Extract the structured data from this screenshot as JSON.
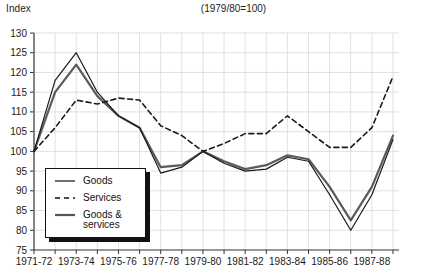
{
  "axis": {
    "y_title": "Index",
    "y_ticks": [
      130,
      125,
      120,
      115,
      110,
      105,
      100,
      95,
      90,
      85,
      80,
      75
    ],
    "x_ticks_visible": [
      "1971-72",
      "1973-74",
      "1975-76",
      "1977-78",
      "1979-80",
      "1981-82",
      "1983-84",
      "1985-86",
      "1987-88"
    ]
  },
  "legend": {
    "items": [
      {
        "label": "Goods",
        "icon": "solid-thin-line-swatch"
      },
      {
        "label": "Services",
        "icon": "dashed-line-swatch"
      },
      {
        "label": "Goods &\nservices",
        "icon": "solid-thick-line-swatch"
      }
    ]
  },
  "colors": {
    "goods": "#1a1a1a",
    "services": "#1a1a1a",
    "goods_and_services": "#5a5a5a",
    "grid": "#d8d8d8",
    "axis": "#555555",
    "background": "#ffffff"
  },
  "chart_data": {
    "type": "line",
    "title": "(1979/80=100)",
    "xlabel": "",
    "ylabel": "Index",
    "ylim": [
      75,
      130
    ],
    "ytick_step": 5,
    "grid": true,
    "legend_position": "bottom-left",
    "x": [
      "1971-72",
      "1972-73",
      "1973-74",
      "1974-75",
      "1975-76",
      "1976-77",
      "1977-78",
      "1978-79",
      "1979-80",
      "1980-81",
      "1981-82",
      "1982-83",
      "1983-84",
      "1984-85",
      "1985-86",
      "1986-87",
      "1987-88",
      "1988-89"
    ],
    "x_labeled": [
      "1971-72",
      "",
      "1973-74",
      "",
      "1975-76",
      "",
      "1977-78",
      "",
      "1979-80",
      "",
      "1981-82",
      "",
      "1983-84",
      "",
      "1985-86",
      "",
      "1987-88",
      ""
    ],
    "series": [
      {
        "name": "Goods",
        "style": "solid-thin",
        "color": "#1a1a1a",
        "values": [
          100,
          118,
          125,
          115,
          109,
          106,
          94.5,
          96,
          100,
          97,
          95,
          95.5,
          98.5,
          97.5,
          89,
          80,
          89,
          103
        ]
      },
      {
        "name": "Services",
        "style": "dashed",
        "color": "#1a1a1a",
        "values": [
          100,
          106,
          113,
          112,
          113.5,
          113,
          106.5,
          104,
          100,
          102,
          104.5,
          104.5,
          109,
          105,
          101,
          101,
          106,
          119
        ]
      },
      {
        "name": "Goods & services",
        "style": "solid-thick",
        "color": "#5a5a5a",
        "values": [
          100,
          115,
          122,
          114,
          109,
          106,
          96,
          96.5,
          100,
          97.5,
          95.5,
          96.5,
          99,
          98,
          91,
          82.5,
          91,
          104
        ]
      }
    ]
  }
}
